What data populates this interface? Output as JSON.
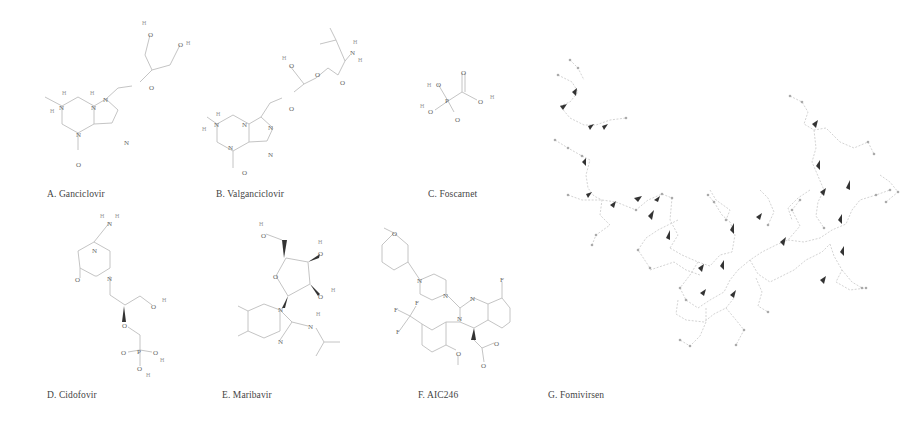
{
  "figure": {
    "panels": [
      {
        "id": "A",
        "label": "A. Ganciclovir"
      },
      {
        "id": "B",
        "label": "B. Valganciclovir"
      },
      {
        "id": "C",
        "label": "C. Foscarnet"
      },
      {
        "id": "D",
        "label": "D. Cidofovir"
      },
      {
        "id": "E",
        "label": "E. Maribavir"
      },
      {
        "id": "F",
        "label": "F. AIC246"
      },
      {
        "id": "G",
        "label": "G. Fomivirsen"
      }
    ]
  },
  "atoms": {
    "N": "N",
    "O": "O",
    "H": "H",
    "P": "P",
    "F": "F"
  },
  "colors": {
    "background": "#ffffff",
    "bond": "#bdbdbd",
    "wedge": "#333333",
    "text": "#444444"
  }
}
